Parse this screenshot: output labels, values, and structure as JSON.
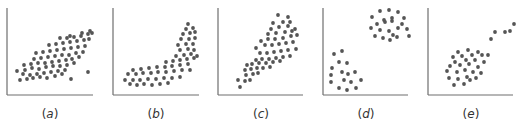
{
  "figure": {
    "panel_count": 5,
    "dot_color": "#555555",
    "axis_color": "#6e6e6e"
  },
  "chart_data": [
    {
      "type": "scatter",
      "id": "a",
      "label": "(a)",
      "title": "",
      "xlabel": "",
      "ylabel": "",
      "description": "positive linear correlation",
      "axes": {
        "x0": 7,
        "y0": 95,
        "x1": 93,
        "y1": 8
      },
      "points": [
        [
          20,
          80
        ],
        [
          27,
          79
        ],
        [
          33,
          78
        ],
        [
          40,
          77
        ],
        [
          47,
          78
        ],
        [
          55,
          76
        ],
        [
          62,
          74
        ],
        [
          71,
          79
        ],
        [
          23,
          74
        ],
        [
          30,
          75
        ],
        [
          37,
          74
        ],
        [
          44,
          73
        ],
        [
          51,
          72
        ],
        [
          58,
          71
        ],
        [
          65,
          70
        ],
        [
          17,
          71
        ],
        [
          25,
          70
        ],
        [
          32,
          68
        ],
        [
          39,
          69
        ],
        [
          46,
          67
        ],
        [
          53,
          66
        ],
        [
          60,
          66
        ],
        [
          67,
          65
        ],
        [
          74,
          63
        ],
        [
          24,
          65
        ],
        [
          31,
          64
        ],
        [
          38,
          63
        ],
        [
          45,
          63
        ],
        [
          52,
          62
        ],
        [
          59,
          61
        ],
        [
          66,
          60
        ],
        [
          72,
          59
        ],
        [
          79,
          57
        ],
        [
          34,
          59
        ],
        [
          41,
          58
        ],
        [
          48,
          57
        ],
        [
          55,
          56
        ],
        [
          62,
          55
        ],
        [
          69,
          55
        ],
        [
          76,
          53
        ],
        [
          83,
          52
        ],
        [
          36,
          53
        ],
        [
          43,
          52
        ],
        [
          50,
          51
        ],
        [
          57,
          50
        ],
        [
          64,
          49
        ],
        [
          71,
          48
        ],
        [
          78,
          47
        ],
        [
          85,
          46
        ],
        [
          49,
          45
        ],
        [
          56,
          44
        ],
        [
          63,
          43
        ],
        [
          70,
          42
        ],
        [
          77,
          41
        ],
        [
          84,
          40
        ],
        [
          89,
          39
        ],
        [
          60,
          38
        ],
        [
          67,
          38
        ],
        [
          74,
          37
        ],
        [
          81,
          36
        ],
        [
          88,
          34
        ],
        [
          92,
          33
        ],
        [
          70,
          36
        ],
        [
          82,
          33
        ],
        [
          90,
          31
        ],
        [
          88,
          72
        ]
      ]
    },
    {
      "type": "scatter",
      "id": "b",
      "label": "(b)",
      "title": "",
      "xlabel": "",
      "ylabel": "",
      "description": "nonlinear (curved) relationship",
      "axes": {
        "x0": 113,
        "y0": 95,
        "x1": 199,
        "y1": 8
      },
      "points": [
        [
          130,
          84
        ],
        [
          137,
          85
        ],
        [
          144,
          84
        ],
        [
          152,
          85
        ],
        [
          160,
          84
        ],
        [
          168,
          83
        ],
        [
          125,
          80
        ],
        [
          133,
          80
        ],
        [
          140,
          80
        ],
        [
          148,
          79
        ],
        [
          156,
          79
        ],
        [
          164,
          78
        ],
        [
          172,
          78
        ],
        [
          180,
          77
        ],
        [
          128,
          74
        ],
        [
          136,
          74
        ],
        [
          143,
          73
        ],
        [
          151,
          73
        ],
        [
          158,
          72
        ],
        [
          166,
          72
        ],
        [
          174,
          71
        ],
        [
          182,
          70
        ],
        [
          190,
          70
        ],
        [
          133,
          70
        ],
        [
          141,
          69
        ],
        [
          149,
          68
        ],
        [
          157,
          67
        ],
        [
          165,
          67
        ],
        [
          172,
          66
        ],
        [
          180,
          65
        ],
        [
          188,
          64
        ],
        [
          166,
          62
        ],
        [
          173,
          61
        ],
        [
          180,
          60
        ],
        [
          187,
          59
        ],
        [
          194,
          58
        ],
        [
          176,
          56
        ],
        [
          184,
          55
        ],
        [
          191,
          54
        ],
        [
          197,
          56
        ],
        [
          180,
          50
        ],
        [
          188,
          49
        ],
        [
          194,
          50
        ],
        [
          178,
          45
        ],
        [
          186,
          44
        ],
        [
          193,
          44
        ],
        [
          181,
          39
        ],
        [
          189,
          39
        ],
        [
          195,
          38
        ],
        [
          183,
          34
        ],
        [
          190,
          33
        ],
        [
          195,
          32
        ],
        [
          186,
          29
        ],
        [
          193,
          28
        ],
        [
          188,
          24
        ]
      ]
    },
    {
      "type": "scatter",
      "id": "c",
      "label": "(c)",
      "title": "",
      "xlabel": "",
      "ylabel": "",
      "description": "positive correlation with increasing spread (heteroscedastic)",
      "axes": {
        "x0": 218,
        "y0": 95,
        "x1": 303,
        "y1": 8
      },
      "points": [
        [
          240,
          87
        ],
        [
          238,
          80
        ],
        [
          245,
          81
        ],
        [
          250,
          80
        ],
        [
          246,
          75
        ],
        [
          253,
          74
        ],
        [
          258,
          73
        ],
        [
          245,
          70
        ],
        [
          251,
          69
        ],
        [
          257,
          68
        ],
        [
          263,
          68
        ],
        [
          270,
          67
        ],
        [
          252,
          64
        ],
        [
          259,
          63
        ],
        [
          266,
          63
        ],
        [
          273,
          62
        ],
        [
          280,
          61
        ],
        [
          247,
          65
        ],
        [
          256,
          60
        ],
        [
          262,
          59
        ],
        [
          269,
          59
        ],
        [
          276,
          58
        ],
        [
          283,
          57
        ],
        [
          290,
          56
        ],
        [
          260,
          53
        ],
        [
          267,
          53
        ],
        [
          274,
          52
        ],
        [
          281,
          51
        ],
        [
          288,
          50
        ],
        [
          296,
          49
        ],
        [
          256,
          48
        ],
        [
          265,
          45
        ],
        [
          272,
          45
        ],
        [
          279,
          44
        ],
        [
          286,
          43
        ],
        [
          293,
          42
        ],
        [
          261,
          41
        ],
        [
          268,
          39
        ],
        [
          275,
          39
        ],
        [
          283,
          38
        ],
        [
          291,
          36
        ],
        [
          297,
          35
        ],
        [
          268,
          34
        ],
        [
          276,
          33
        ],
        [
          285,
          32
        ],
        [
          292,
          31
        ],
        [
          271,
          29
        ],
        [
          279,
          27
        ],
        [
          288,
          26
        ],
        [
          295,
          29
        ],
        [
          273,
          23
        ],
        [
          283,
          22
        ],
        [
          290,
          22
        ],
        [
          278,
          15
        ],
        [
          288,
          17
        ]
      ]
    },
    {
      "type": "scatter",
      "id": "d",
      "label": "(d)",
      "title": "",
      "xlabel": "",
      "ylabel": "",
      "description": "two distinct clusters",
      "axes": {
        "x0": 323,
        "y0": 95,
        "x1": 408,
        "y1": 8
      },
      "points": [
        [
          334,
          54
        ],
        [
          342,
          51
        ],
        [
          339,
          62
        ],
        [
          347,
          63
        ],
        [
          332,
          68
        ],
        [
          331,
          75
        ],
        [
          342,
          72
        ],
        [
          348,
          74
        ],
        [
          355,
          72
        ],
        [
          331,
          82
        ],
        [
          344,
          80
        ],
        [
          351,
          82
        ],
        [
          361,
          80
        ],
        [
          339,
          88
        ],
        [
          347,
          90
        ],
        [
          356,
          88
        ],
        [
          380,
          11
        ],
        [
          389,
          10
        ],
        [
          398,
          12
        ],
        [
          372,
          17
        ],
        [
          384,
          20
        ],
        [
          392,
          18
        ],
        [
          404,
          18
        ],
        [
          377,
          24
        ],
        [
          385,
          22
        ],
        [
          392,
          21
        ],
        [
          402,
          24
        ],
        [
          371,
          28
        ],
        [
          380,
          30
        ],
        [
          389,
          31
        ],
        [
          398,
          28
        ],
        [
          407,
          29
        ],
        [
          375,
          36
        ],
        [
          383,
          38
        ],
        [
          393,
          35
        ],
        [
          390,
          40
        ],
        [
          397,
          37
        ],
        [
          409,
          36
        ]
      ]
    },
    {
      "type": "scatter",
      "id": "e",
      "label": "(e)",
      "title": "",
      "xlabel": "",
      "ylabel": "",
      "description": "positive correlation with outlying subgroup",
      "axes": {
        "x0": 428,
        "y0": 95,
        "x1": 513,
        "y1": 8
      },
      "points": [
        [
          458,
          52
        ],
        [
          468,
          50
        ],
        [
          478,
          52
        ],
        [
          453,
          57
        ],
        [
          462,
          56
        ],
        [
          472,
          55
        ],
        [
          482,
          55
        ],
        [
          488,
          55
        ],
        [
          455,
          62
        ],
        [
          466,
          60
        ],
        [
          475,
          60
        ],
        [
          484,
          62
        ],
        [
          450,
          66
        ],
        [
          460,
          65
        ],
        [
          469,
          64
        ],
        [
          478,
          67
        ],
        [
          447,
          71
        ],
        [
          457,
          72
        ],
        [
          465,
          70
        ],
        [
          473,
          72
        ],
        [
          481,
          73
        ],
        [
          449,
          78
        ],
        [
          458,
          79
        ],
        [
          467,
          77
        ],
        [
          476,
          78
        ],
        [
          454,
          85
        ],
        [
          464,
          84
        ],
        [
          470,
          80
        ],
        [
          491,
          39
        ],
        [
          495,
          32
        ],
        [
          505,
          32
        ],
        [
          510,
          31
        ],
        [
          514,
          24
        ]
      ]
    }
  ],
  "labels": {
    "a_prefix": "(",
    "a": "a",
    "a_suffix": ")",
    "b_prefix": "(",
    "b": "b",
    "b_suffix": ")",
    "c_prefix": "(",
    "c": "c",
    "c_suffix": ")",
    "d_prefix": "(",
    "d": "d",
    "d_suffix": ")",
    "e_prefix": "(",
    "e": "e",
    "e_suffix": ")"
  }
}
